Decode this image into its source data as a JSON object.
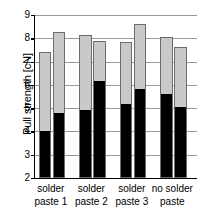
{
  "chart_data": {
    "type": "bar",
    "title": "",
    "xlabel": "",
    "ylabel": "Pull strength [cN]",
    "ylim": [
      2,
      9
    ],
    "yticks": [
      2,
      3,
      4,
      5,
      6,
      7,
      8,
      9
    ],
    "ytick_labels": [
      "2",
      "3",
      "4",
      "5",
      "6",
      "7",
      "8",
      "9"
    ],
    "grid": true,
    "legend": "none",
    "stacked": true,
    "bars_per_group": 2,
    "categories": [
      "solder paste 1",
      "solder paste 2",
      "solder paste 3",
      "no solder paste"
    ],
    "series": [
      {
        "name": "lower (black)",
        "color": "#000000",
        "values": [
          [
            3.98,
            4.74
          ],
          [
            4.86,
            6.12
          ],
          [
            5.12,
            5.76
          ],
          [
            5.56,
            5.0
          ]
        ]
      },
      {
        "name": "upper (gray)",
        "color": "#c9c9c9",
        "values": [
          [
            7.4,
            8.29
          ],
          [
            8.16,
            7.9
          ],
          [
            7.82,
            8.62
          ],
          [
            8.06,
            7.64
          ]
        ]
      }
    ],
    "bar_tops": [
      [
        7.4,
        8.29
      ],
      [
        8.16,
        7.9
      ],
      [
        7.82,
        8.62
      ],
      [
        8.06,
        7.64
      ]
    ],
    "bar_splits": [
      [
        3.98,
        4.74
      ],
      [
        4.86,
        6.12
      ],
      [
        5.12,
        5.76
      ],
      [
        5.56,
        5.0
      ]
    ]
  },
  "labels": {
    "groups": [
      {
        "line1": "solder",
        "line2": "paste 1"
      },
      {
        "line1": "solder",
        "line2": "paste 2"
      },
      {
        "line1": "solder",
        "line2": "paste 3"
      },
      {
        "line1": "no solder",
        "line2": "paste"
      }
    ]
  },
  "colors": {
    "bar_upper": "#c9c9c9",
    "bar_lower": "#000000",
    "bar_outline": "#6d6d6d",
    "gridline": "#9a9a9a",
    "axis": "#000000",
    "background": "#ffffff",
    "text": "#000000"
  }
}
